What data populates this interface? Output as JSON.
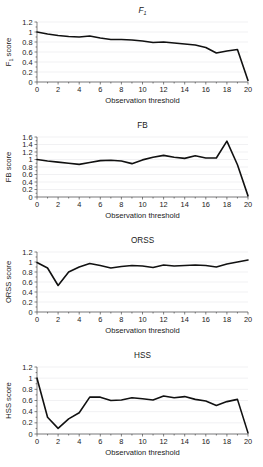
{
  "figure": {
    "caption_none": "",
    "panel_count": 4
  },
  "shared": {
    "xlabel": "Observation threshold",
    "x_ticks": [
      0,
      2,
      4,
      6,
      8,
      10,
      12,
      14,
      16,
      18,
      20
    ],
    "xlim": [
      0,
      20
    ],
    "line_color": "#111111",
    "grid_color": "#e2e2e6",
    "axis_color": "#4a4a4a"
  },
  "chart_data": [
    {
      "type": "line",
      "id": "f1",
      "title": "F",
      "title_sub": "1",
      "title_italic": true,
      "ylabel": "F",
      "ylabel_sub": "1",
      "ylabel_suffix": " score",
      "xlabel": "Observation threshold",
      "xlim": [
        0,
        20
      ],
      "ylim": [
        0,
        1.2
      ],
      "y_ticks": [
        0,
        0.2,
        0.4,
        0.6,
        0.8,
        1,
        1.2
      ],
      "y_tick_labels": [
        "0",
        "0.2",
        "0.4",
        "0.6",
        "0.8",
        "1",
        "1.2"
      ],
      "x_ticks": [
        0,
        2,
        4,
        6,
        8,
        10,
        12,
        14,
        16,
        18,
        20
      ],
      "x_tick_labels": [
        "0",
        "2",
        "4",
        "6",
        "8",
        "10",
        "12",
        "14",
        "16",
        "18",
        "20"
      ],
      "grid": true,
      "legend": "none",
      "x": [
        0,
        1,
        2,
        3,
        4,
        5,
        6,
        7,
        8,
        9,
        10,
        11,
        12,
        13,
        14,
        15,
        16,
        17,
        18,
        19,
        20
      ],
      "values": [
        1.0,
        0.96,
        0.93,
        0.91,
        0.9,
        0.92,
        0.88,
        0.85,
        0.85,
        0.84,
        0.82,
        0.79,
        0.8,
        0.78,
        0.76,
        0.74,
        0.69,
        0.58,
        0.62,
        0.65,
        0.03
      ]
    },
    {
      "type": "line",
      "id": "fb",
      "title": "FB",
      "title_sub": "",
      "title_italic": false,
      "ylabel": "FB score",
      "ylabel_sub": "",
      "ylabel_suffix": "",
      "xlabel": "Observation threshold",
      "xlim": [
        0,
        20
      ],
      "ylim": [
        0,
        1.6
      ],
      "y_ticks": [
        0,
        0.2,
        0.4,
        0.6,
        0.8,
        1,
        1.2,
        1.4,
        1.6
      ],
      "y_tick_labels": [
        "0",
        "0.2",
        "0.4",
        "0.6",
        "0.8",
        "1",
        "1.2",
        "1.4",
        "1.6"
      ],
      "x_ticks": [
        0,
        2,
        4,
        6,
        8,
        10,
        12,
        14,
        16,
        18,
        20
      ],
      "x_tick_labels": [
        "0",
        "2",
        "4",
        "6",
        "8",
        "10",
        "12",
        "14",
        "16",
        "18",
        "20"
      ],
      "grid": true,
      "legend": "none",
      "x": [
        0,
        1,
        2,
        3,
        4,
        5,
        6,
        7,
        8,
        9,
        10,
        11,
        12,
        13,
        14,
        15,
        16,
        17,
        18,
        19,
        20
      ],
      "values": [
        1.0,
        0.96,
        0.93,
        0.9,
        0.87,
        0.92,
        0.97,
        0.98,
        0.96,
        0.89,
        0.99,
        1.06,
        1.11,
        1.06,
        1.03,
        1.1,
        1.04,
        1.04,
        1.49,
        0.86,
        0.03
      ]
    },
    {
      "type": "line",
      "id": "orss",
      "title": "ORSS",
      "title_sub": "",
      "title_italic": false,
      "ylabel": "ORSS score",
      "ylabel_sub": "",
      "ylabel_suffix": "",
      "xlabel": "Observation threshold",
      "xlim": [
        0,
        20
      ],
      "ylim": [
        0,
        1.2
      ],
      "y_ticks": [
        0,
        0.2,
        0.4,
        0.6,
        0.8,
        1,
        1.2
      ],
      "y_tick_labels": [
        "0",
        "0.2",
        "0.4",
        "0.6",
        "0.8",
        "1",
        "1.2"
      ],
      "x_ticks": [
        0,
        2,
        4,
        6,
        8,
        10,
        12,
        14,
        16,
        18,
        20
      ],
      "x_tick_labels": [
        "0",
        "2",
        "4",
        "6",
        "8",
        "10",
        "12",
        "14",
        "16",
        "18",
        "20"
      ],
      "grid": true,
      "legend": "none",
      "x": [
        0,
        1,
        2,
        3,
        4,
        5,
        6,
        7,
        8,
        9,
        10,
        11,
        12,
        13,
        14,
        15,
        16,
        17,
        18,
        19,
        20
      ],
      "values": [
        0.99,
        0.88,
        0.53,
        0.8,
        0.9,
        0.97,
        0.93,
        0.88,
        0.91,
        0.93,
        0.92,
        0.89,
        0.94,
        0.92,
        0.93,
        0.94,
        0.93,
        0.9,
        0.96,
        1.0,
        1.04
      ]
    },
    {
      "type": "line",
      "id": "hss",
      "title": "HSS",
      "title_sub": "",
      "title_italic": false,
      "ylabel": "HSS score",
      "ylabel_sub": "",
      "ylabel_suffix": "",
      "xlabel": "Observation threshold",
      "xlim": [
        0,
        20
      ],
      "ylim": [
        0,
        1.2
      ],
      "y_ticks": [
        0,
        0.2,
        0.4,
        0.6,
        0.8,
        1,
        1.2
      ],
      "y_tick_labels": [
        "0",
        "0.2",
        "0.4",
        "0.6",
        "0.8",
        "1",
        "1.2"
      ],
      "x_ticks": [
        0,
        2,
        4,
        6,
        8,
        10,
        12,
        14,
        16,
        18,
        20
      ],
      "x_tick_labels": [
        "0",
        "2",
        "4",
        "6",
        "8",
        "10",
        "12",
        "14",
        "16",
        "18",
        "20"
      ],
      "grid": true,
      "legend": "none",
      "x": [
        0,
        1,
        2,
        3,
        4,
        5,
        6,
        7,
        8,
        9,
        10,
        11,
        12,
        13,
        14,
        15,
        16,
        17,
        18,
        19,
        20
      ],
      "values": [
        1.0,
        0.3,
        0.1,
        0.27,
        0.38,
        0.66,
        0.66,
        0.6,
        0.61,
        0.65,
        0.63,
        0.61,
        0.68,
        0.65,
        0.67,
        0.62,
        0.59,
        0.51,
        0.58,
        0.62,
        0.02
      ]
    }
  ]
}
